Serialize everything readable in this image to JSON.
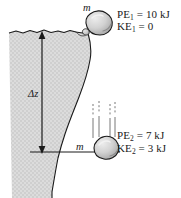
{
  "figure": {
    "colors": {
      "cliff_fill": "#d7d7d7",
      "outline": "#1a1a1a",
      "rock_fill": "#cfcfcf",
      "rock_highlight": "#e8e8e8",
      "rock_shadow": "#9a9a9a",
      "text": "#1a1a1a",
      "background": "#ffffff"
    }
  },
  "labels": {
    "mass_top": "m",
    "mass_bottom": "m",
    "height_symbol": "Δz"
  },
  "state_1": {
    "pe_symbol": "PE",
    "pe_subscript": "1",
    "pe_text": " = 10 kJ",
    "ke_symbol": "KE",
    "ke_subscript": "1",
    "ke_text": " = 0",
    "pe_value": 10,
    "ke_value": 0,
    "unit": "kJ"
  },
  "state_2": {
    "pe_symbol": "PE",
    "pe_subscript": "2",
    "pe_text": " = 7 kJ",
    "ke_symbol": "KE",
    "ke_subscript": "2",
    "ke_text": " = 3 kJ",
    "pe_value": 7,
    "ke_value": 3,
    "unit": "kJ"
  }
}
